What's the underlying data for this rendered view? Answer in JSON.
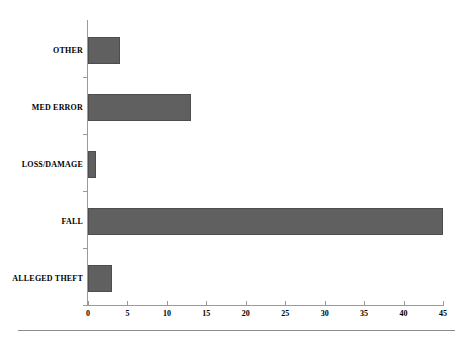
{
  "chart_data": {
    "type": "bar",
    "orientation": "horizontal",
    "title": "",
    "subtitle": "",
    "xlabel": "",
    "ylabel": "",
    "categories": [
      "ALLEGED THEFT",
      "FALL",
      "LOSS/DAMAGE",
      "MED ERROR",
      "OTHER"
    ],
    "values": [
      3,
      45,
      1,
      13,
      4
    ],
    "series": [
      {
        "name": "Incidents",
        "values": [
          3,
          45,
          1,
          13,
          4
        ]
      }
    ],
    "xlim": [
      0,
      45
    ],
    "ylim": [
      0,
      5
    ],
    "xticks": [
      0,
      5,
      10,
      15,
      20,
      25,
      30,
      35,
      40,
      45
    ],
    "xtick_labels": [
      "0",
      "5",
      "10",
      "15",
      "20",
      "25",
      "30",
      "35",
      "40",
      "45"
    ],
    "grid": false,
    "legend": false,
    "legend_position": "none",
    "bar_color": "#606060",
    "bar_edge_color": "#4d4d4d",
    "axis_color": "#9a9a9a",
    "background_color": "#ffffff",
    "text_color": "#000000",
    "annotations": []
  }
}
